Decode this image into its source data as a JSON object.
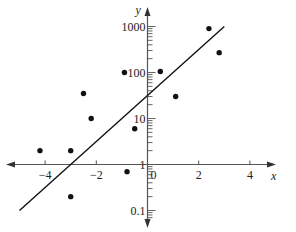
{
  "chart_data": {
    "type": "scatter",
    "title": "",
    "xlabel": "x",
    "ylabel": "y",
    "yscale": "log",
    "xlim": [
      -5,
      5
    ],
    "ylim": [
      0.05,
      2000
    ],
    "x_ticks": [
      -4,
      -2,
      0,
      2,
      4
    ],
    "x_tick_labels": [
      "−4",
      "−2",
      "0",
      "2",
      "4"
    ],
    "y_ticks": [
      0.1,
      1,
      10,
      100,
      1000
    ],
    "y_tick_labels": [
      "0.1",
      "1",
      "10",
      "100",
      "1000"
    ],
    "grid": false,
    "legend": null,
    "points": [
      {
        "x": -4.2,
        "y": 2
      },
      {
        "x": -3.0,
        "y": 2
      },
      {
        "x": -3.0,
        "y": 0.2
      },
      {
        "x": -2.5,
        "y": 35
      },
      {
        "x": -2.2,
        "y": 10
      },
      {
        "x": -0.9,
        "y": 100
      },
      {
        "x": -0.5,
        "y": 6
      },
      {
        "x": -0.8,
        "y": 0.7
      },
      {
        "x": 0.5,
        "y": 105
      },
      {
        "x": 1.1,
        "y": 30
      },
      {
        "x": 2.4,
        "y": 900
      },
      {
        "x": 2.8,
        "y": 270
      }
    ],
    "fit_line": {
      "x_start": -5.0,
      "y_start": 0.1,
      "x_end": 3.0,
      "y_end": 1000,
      "description": "least-squares exponential fit line on semi-log axes"
    }
  },
  "axes": {
    "x_label": "x",
    "y_label": "y"
  }
}
